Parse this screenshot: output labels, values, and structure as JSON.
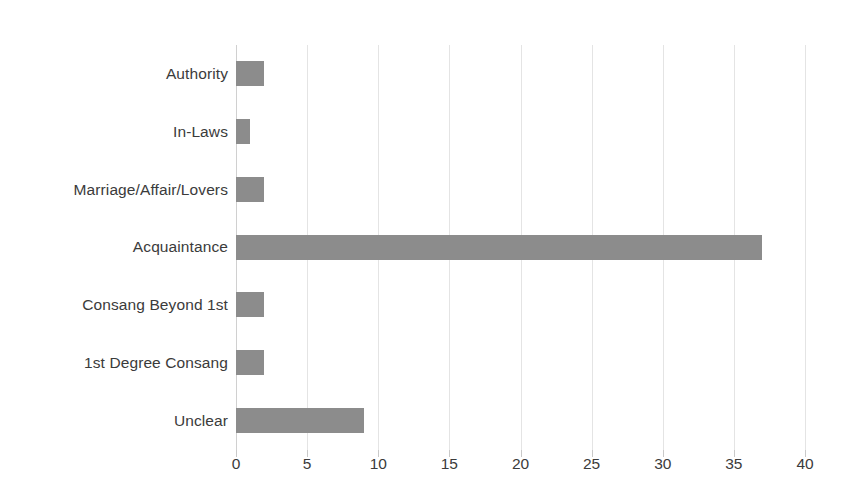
{
  "chart_data": {
    "type": "bar",
    "orientation": "horizontal",
    "title": "",
    "subtitle": "",
    "xlabel": "",
    "ylabel": "",
    "categories": [
      "Authority",
      "In-Laws",
      "Marriage/Affair/Lovers",
      "Acquaintance",
      "Consang Beyond 1st",
      "1st Degree Consang",
      "Unclear"
    ],
    "values": [
      2,
      1,
      2,
      37,
      2,
      2,
      9
    ],
    "series": [
      {
        "name": "Count",
        "values": [
          2,
          1,
          2,
          37,
          2,
          2,
          9
        ]
      }
    ],
    "xlim": [
      0,
      40
    ],
    "xticks": [
      0,
      5,
      10,
      15,
      20,
      25,
      30,
      35,
      40
    ],
    "xtick_labels": [
      "0",
      "5",
      "10",
      "15",
      "20",
      "25",
      "30",
      "35",
      "40"
    ],
    "grid": true,
    "grid_axis": "x",
    "legend": false,
    "legend_position": "none",
    "bar_color": "#8c8c8c",
    "grid_color": "#e4e4e4",
    "text_color": "#3b3b3b",
    "background_color": "#ffffff"
  }
}
